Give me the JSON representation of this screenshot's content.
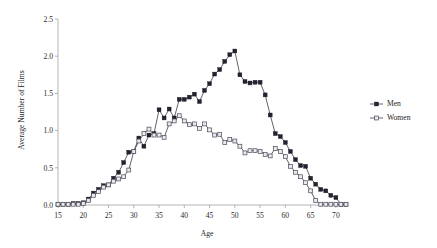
{
  "chart_data": {
    "type": "line",
    "title": "",
    "xlabel": "Age",
    "ylabel": "Average Number of Films",
    "xlim": [
      15,
      72
    ],
    "ylim": [
      0.0,
      2.5
    ],
    "grid": false,
    "legend_position": "right",
    "xticks": [
      "15",
      "20",
      "25",
      "30",
      "35",
      "40",
      "45",
      "50",
      "55",
      "60",
      "65",
      "70"
    ],
    "xtick_values": [
      15,
      20,
      25,
      30,
      35,
      40,
      45,
      50,
      55,
      60,
      65,
      70
    ],
    "yticks": [
      "0.0",
      "0.5",
      "1.0",
      "1.5",
      "2.0",
      "2.5"
    ],
    "ytick_values": [
      0.0,
      0.5,
      1.0,
      1.5,
      2.0,
      2.5
    ],
    "x": [
      15,
      16,
      17,
      18,
      19,
      20,
      21,
      22,
      23,
      24,
      25,
      26,
      27,
      28,
      29,
      30,
      31,
      32,
      33,
      34,
      35,
      36,
      37,
      38,
      39,
      40,
      41,
      42,
      43,
      44,
      45,
      46,
      47,
      48,
      49,
      50,
      51,
      52,
      53,
      54,
      55,
      56,
      57,
      58,
      59,
      60,
      61,
      62,
      63,
      64,
      65,
      66,
      67,
      68,
      69,
      70,
      71,
      72
    ],
    "series": [
      {
        "name": "Men",
        "marker": "filled-square",
        "color": "#222230",
        "values": [
          0.01,
          0.01,
          0.01,
          0.02,
          0.02,
          0.03,
          0.08,
          0.16,
          0.21,
          0.26,
          0.27,
          0.36,
          0.44,
          0.57,
          0.71,
          0.72,
          0.9,
          0.79,
          0.94,
          0.96,
          1.28,
          1.17,
          1.29,
          1.17,
          1.42,
          1.42,
          1.45,
          1.49,
          1.39,
          1.54,
          1.63,
          1.76,
          1.82,
          1.93,
          2.02,
          2.07,
          1.75,
          1.66,
          1.64,
          1.65,
          1.65,
          1.48,
          1.21,
          0.96,
          0.92,
          0.84,
          0.72,
          0.61,
          0.53,
          0.52,
          0.36,
          0.28,
          0.21,
          0.19,
          0.13,
          0.1,
          0.01,
          0.01
        ]
      },
      {
        "name": "Women",
        "marker": "open-square",
        "color": "#e9e9ee",
        "values": [
          0.01,
          0.01,
          0.01,
          0.01,
          0.01,
          0.02,
          0.06,
          0.13,
          0.18,
          0.24,
          0.27,
          0.32,
          0.35,
          0.38,
          0.47,
          0.72,
          0.86,
          0.96,
          1.02,
          0.94,
          0.94,
          0.91,
          1.09,
          1.13,
          1.2,
          1.13,
          1.08,
          1.09,
          1.03,
          1.09,
          1.01,
          0.94,
          0.95,
          0.84,
          0.88,
          0.86,
          0.79,
          0.7,
          0.73,
          0.73,
          0.72,
          0.68,
          0.66,
          0.76,
          0.72,
          0.65,
          0.52,
          0.44,
          0.38,
          0.3,
          0.19,
          0.06,
          0.01,
          0.01,
          0.01,
          0.01,
          0.01,
          0.01
        ]
      }
    ],
    "legend": [
      {
        "label": "Men",
        "marker": "filled-square"
      },
      {
        "label": "Women",
        "marker": "open-square"
      }
    ]
  }
}
